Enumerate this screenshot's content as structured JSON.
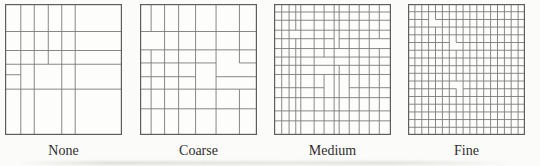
{
  "figure": {
    "colors": {
      "background": "#fbfbf9",
      "panel_fill": "#fdfdfc",
      "line": "#7a7a7a",
      "border": "#5e5e5e",
      "label_text": "#2e2e2e"
    },
    "panels": [
      {
        "label": "None",
        "grid": {
          "verticals": [
            {
              "x": 0.135,
              "segs": [
                [
                  0,
                  1
                ]
              ]
            },
            {
              "x": 0.25,
              "segs": [
                [
                  0,
                  1
                ]
              ]
            },
            {
              "x": 0.37,
              "segs": [
                [
                  0,
                  0.46
                ]
              ]
            },
            {
              "x": 0.485,
              "segs": [
                [
                  0,
                  1
                ]
              ]
            },
            {
              "x": 0.6,
              "segs": [
                [
                  0,
                  1
                ]
              ]
            }
          ],
          "horizontals": [
            {
              "y": 0.21,
              "segs": [
                [
                  0,
                  1
                ]
              ]
            },
            {
              "y": 0.355,
              "segs": [
                [
                  0,
                  1
                ]
              ]
            },
            {
              "y": 0.46,
              "segs": [
                [
                  0,
                  1
                ]
              ]
            },
            {
              "y": 0.54,
              "segs": [
                [
                  0,
                  0.135
                ]
              ]
            },
            {
              "y": 0.65,
              "segs": [
                [
                  0,
                  1
                ]
              ]
            }
          ]
        }
      },
      {
        "label": "Coarse",
        "grid": {
          "verticals": [
            {
              "x": 0.095,
              "segs": [
                [
                  0,
                  0.21
                ],
                [
                  0.35,
                  1
                ]
              ]
            },
            {
              "x": 0.21,
              "segs": [
                [
                  0,
                  1
                ]
              ]
            },
            {
              "x": 0.33,
              "segs": [
                [
                  0,
                  1
                ]
              ]
            },
            {
              "x": 0.475,
              "segs": [
                [
                  0,
                  1
                ]
              ]
            },
            {
              "x": 0.65,
              "segs": [
                [
                  0,
                  1
                ]
              ]
            },
            {
              "x": 0.85,
              "segs": [
                [
                  0,
                  0.45
                ],
                [
                  0.65,
                  1
                ]
              ]
            }
          ],
          "horizontals": [
            {
              "y": 0.21,
              "segs": [
                [
                  0,
                  1
                ]
              ]
            },
            {
              "y": 0.35,
              "segs": [
                [
                  0,
                  1
                ]
              ]
            },
            {
              "y": 0.45,
              "segs": [
                [
                  0,
                  0.65
                ],
                [
                  0.85,
                  1
                ]
              ]
            },
            {
              "y": 0.555,
              "segs": [
                [
                  0,
                  0.475
                ],
                [
                  0.65,
                  1
                ]
              ]
            },
            {
              "y": 0.65,
              "segs": [
                [
                  0,
                  1
                ]
              ]
            },
            {
              "y": 0.8,
              "segs": [
                [
                  0,
                  1
                ]
              ]
            }
          ]
        }
      },
      {
        "label": "Medium",
        "grid": {
          "verticals": [
            {
              "x": 0.066,
              "segs": [
                [
                  0,
                  1
                ]
              ]
            },
            {
              "x": 0.129,
              "segs": [
                [
                  0,
                  1
                ]
              ]
            },
            {
              "x": 0.186,
              "segs": [
                [
                  0,
                  0.2
                ],
                [
                  0.265,
                  1
                ]
              ]
            },
            {
              "x": 0.229,
              "segs": [
                [
                  0,
                  1
                ]
              ]
            },
            {
              "x": 0.343,
              "segs": [
                [
                  0,
                  1
                ]
              ]
            },
            {
              "x": 0.428,
              "segs": [
                [
                  0,
                  0.405
                ],
                [
                  0.538,
                  1
                ]
              ]
            },
            {
              "x": 0.514,
              "segs": [
                [
                  0,
                  1
                ]
              ]
            },
            {
              "x": 0.557,
              "segs": [
                [
                  0,
                  0.34
                ],
                [
                  0.468,
                  1
                ]
              ]
            },
            {
              "x": 0.643,
              "segs": [
                [
                  0,
                  1
                ]
              ]
            },
            {
              "x": 0.728,
              "segs": [
                [
                  0,
                  1
                ]
              ]
            },
            {
              "x": 0.814,
              "segs": [
                [
                  0,
                  1
                ]
              ]
            },
            {
              "x": 0.9,
              "segs": [
                [
                  0,
                  0.265
                ],
                [
                  0.34,
                  1
                ]
              ]
            }
          ],
          "horizontals": [
            {
              "y": 0.061,
              "segs": [
                [
                  0,
                  1
                ]
              ]
            },
            {
              "y": 0.124,
              "segs": [
                [
                  0,
                  1
                ]
              ]
            },
            {
              "y": 0.2,
              "segs": [
                [
                  0,
                  1
                ]
              ]
            },
            {
              "y": 0.265,
              "segs": [
                [
                  0,
                  0.514
                ],
                [
                  0.557,
                  1
                ]
              ]
            },
            {
              "y": 0.34,
              "segs": [
                [
                  0,
                  1
                ]
              ]
            },
            {
              "y": 0.405,
              "segs": [
                [
                  0,
                  1
                ]
              ]
            },
            {
              "y": 0.468,
              "segs": [
                [
                  0,
                  1
                ]
              ]
            },
            {
              "y": 0.538,
              "segs": [
                [
                  0,
                  1
                ]
              ]
            },
            {
              "y": 0.639,
              "segs": [
                [
                  0,
                  0.428
                ],
                [
                  0.643,
                  1
                ]
              ]
            },
            {
              "y": 0.715,
              "segs": [
                [
                  0,
                  1
                ]
              ]
            },
            {
              "y": 0.816,
              "segs": [
                [
                  0,
                  1
                ]
              ]
            },
            {
              "y": 0.892,
              "segs": [
                [
                  0,
                  1
                ]
              ]
            }
          ]
        }
      },
      {
        "label": "Fine",
        "grid": {
          "verticals": [
            {
              "x": 0.059,
              "segs": [
                [
                  0,
                  1
                ]
              ]
            },
            {
              "x": 0.118,
              "segs": [
                [
                  0,
                  1
                ]
              ]
            },
            {
              "x": 0.176,
              "segs": [
                [
                  0,
                  1
                ]
              ]
            },
            {
              "x": 0.235,
              "segs": [
                [
                  0,
                  0.118
                ],
                [
                  0.176,
                  1
                ]
              ]
            },
            {
              "x": 0.294,
              "segs": [
                [
                  0,
                  1
                ]
              ]
            },
            {
              "x": 0.353,
              "segs": [
                [
                  0,
                  1
                ]
              ]
            },
            {
              "x": 0.412,
              "segs": [
                [
                  0,
                  0.294
                ],
                [
                  0.353,
                  0.588
                ],
                [
                  0.647,
                  1
                ]
              ]
            },
            {
              "x": 0.471,
              "segs": [
                [
                  0,
                  1
                ]
              ]
            },
            {
              "x": 0.529,
              "segs": [
                [
                  0,
                  1
                ]
              ]
            },
            {
              "x": 0.588,
              "segs": [
                [
                  0,
                  1
                ]
              ]
            },
            {
              "x": 0.647,
              "segs": [
                [
                  0,
                  1
                ]
              ]
            },
            {
              "x": 0.706,
              "segs": [
                [
                  0,
                  1
                ]
              ]
            },
            {
              "x": 0.765,
              "segs": [
                [
                  0,
                  1
                ]
              ]
            },
            {
              "x": 0.824,
              "segs": [
                [
                  0,
                  1
                ]
              ]
            },
            {
              "x": 0.882,
              "segs": [
                [
                  0,
                  1
                ]
              ]
            },
            {
              "x": 0.941,
              "segs": [
                [
                  0,
                  1
                ]
              ]
            }
          ],
          "horizontals": [
            {
              "y": 0.059,
              "segs": [
                [
                  0,
                  1
                ]
              ]
            },
            {
              "y": 0.118,
              "segs": [
                [
                  0,
                  0.176
                ],
                [
                  0.235,
                  1
                ]
              ]
            },
            {
              "y": 0.176,
              "segs": [
                [
                  0,
                  1
                ]
              ]
            },
            {
              "y": 0.235,
              "segs": [
                [
                  0,
                  1
                ]
              ]
            },
            {
              "y": 0.294,
              "segs": [
                [
                  0,
                  0.353
                ],
                [
                  0.412,
                  1
                ]
              ]
            },
            {
              "y": 0.353,
              "segs": [
                [
                  0,
                  1
                ]
              ]
            },
            {
              "y": 0.412,
              "segs": [
                [
                  0,
                  1
                ]
              ]
            },
            {
              "y": 0.471,
              "segs": [
                [
                  0,
                  1
                ]
              ]
            },
            {
              "y": 0.529,
              "segs": [
                [
                  0,
                  1
                ]
              ]
            },
            {
              "y": 0.588,
              "segs": [
                [
                  0,
                  1
                ]
              ]
            },
            {
              "y": 0.647,
              "segs": [
                [
                  0,
                  0.412
                ],
                [
                  0.471,
                  1
                ]
              ]
            },
            {
              "y": 0.706,
              "segs": [
                [
                  0,
                  1
                ]
              ]
            },
            {
              "y": 0.765,
              "segs": [
                [
                  0,
                  1
                ]
              ]
            },
            {
              "y": 0.824,
              "segs": [
                [
                  0,
                  1
                ]
              ]
            },
            {
              "y": 0.882,
              "segs": [
                [
                  0,
                  1
                ]
              ]
            },
            {
              "y": 0.941,
              "segs": [
                [
                  0,
                  1
                ]
              ]
            }
          ]
        }
      }
    ]
  }
}
